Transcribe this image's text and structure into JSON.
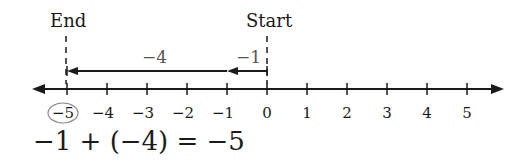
{
  "diagram": {
    "type": "number-line-addition",
    "labels": {
      "end": "End",
      "start": "Start"
    },
    "arrows": [
      {
        "label": "−1",
        "from": 0,
        "to": -1
      },
      {
        "label": "−4",
        "from": -1,
        "to": -5
      }
    ],
    "ticks": [
      "−5",
      "−4",
      "−3",
      "−2",
      "−1",
      "0",
      "1",
      "2",
      "3",
      "4",
      "5"
    ],
    "circled_tick": "−5",
    "equation": "−1 + (−4) = −5",
    "colors": {
      "ink": "#1a1a1a",
      "arrow_label": "#555555",
      "circle": "#888888"
    }
  }
}
